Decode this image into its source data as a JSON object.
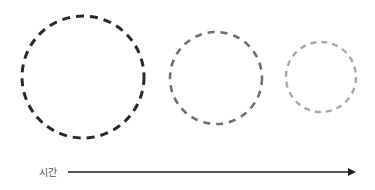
{
  "diagram": {
    "circles": [
      {
        "cx": 83,
        "cy": 77,
        "r": 61,
        "color": "#2a2a2a"
      },
      {
        "cx": 216,
        "cy": 78,
        "r": 46,
        "color": "#707070"
      },
      {
        "cx": 321,
        "cy": 77,
        "r": 35,
        "color": "#a8a8a8"
      }
    ],
    "axis": {
      "label": "시간",
      "color": "#222222",
      "x1": 68,
      "x2": 355,
      "y": 172
    }
  }
}
